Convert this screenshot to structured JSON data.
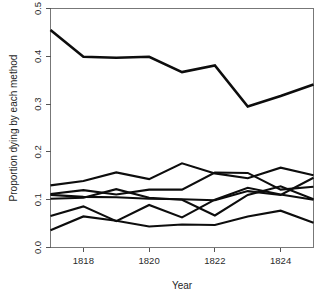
{
  "chart_data": {
    "type": "line",
    "title": "",
    "xlabel": "Year",
    "ylabel": "Proportion dying by each method",
    "x": [
      1817,
      1818,
      1819,
      1820,
      1821,
      1822,
      1823,
      1824,
      1825
    ],
    "xlim": [
      1817,
      1825
    ],
    "ylim": [
      0.0,
      0.5
    ],
    "xticks": [
      1818,
      1820,
      1822,
      1824
    ],
    "xtick_labels": [
      "1818",
      "1820",
      "1822",
      "1824"
    ],
    "yticks": [
      0.0,
      0.1,
      0.2,
      0.3,
      0.4,
      0.5
    ],
    "ytick_labels": [
      "0.0",
      "0.1",
      "0.2",
      "0.3",
      "0.4",
      "0.5"
    ],
    "grid": false,
    "legend": "none",
    "line_color": "#0d0d0d",
    "series": [
      {
        "name": "method-1",
        "values": [
          0.455,
          0.399,
          0.397,
          0.399,
          0.367,
          0.381,
          0.295,
          0.317,
          0.341
        ]
      },
      {
        "name": "method-2",
        "values": [
          0.13,
          0.139,
          0.157,
          0.143,
          0.176,
          0.155,
          0.145,
          0.167,
          0.151
        ]
      },
      {
        "name": "method-3",
        "values": [
          0.112,
          0.12,
          0.111,
          0.121,
          0.121,
          0.157,
          0.156,
          0.121,
          0.127
        ]
      },
      {
        "name": "method-4",
        "values": [
          0.102,
          0.104,
          0.122,
          0.104,
          0.1,
          0.067,
          0.11,
          0.128,
          0.101
        ]
      },
      {
        "name": "method-5",
        "values": [
          0.11,
          0.106,
          0.105,
          0.102,
          0.101,
          0.099,
          0.118,
          0.11,
          0.146
        ]
      },
      {
        "name": "method-6",
        "values": [
          0.066,
          0.086,
          0.055,
          0.089,
          0.063,
          0.1,
          0.125,
          0.111,
          0.1
        ]
      },
      {
        "name": "method-7",
        "values": [
          0.036,
          0.065,
          0.056,
          0.044,
          0.048,
          0.047,
          0.065,
          0.077,
          0.052
        ]
      }
    ]
  },
  "axes": {
    "x_title": "Year",
    "y_title": "Proportion dying by each method"
  }
}
